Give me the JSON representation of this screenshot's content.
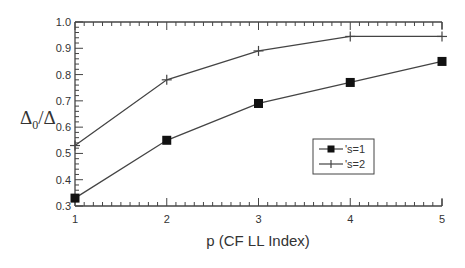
{
  "chart_data": {
    "type": "line",
    "title": "",
    "xlabel": "p (CF LL Index)",
    "ylabel": "Δ0/Δ",
    "ylabel_main": "Δ",
    "ylabel_sub": "0",
    "ylabel_tail": "/Δ",
    "x": [
      1,
      2,
      3,
      4,
      5
    ],
    "xlim": [
      1,
      5
    ],
    "ylim": [
      0.3,
      1.0
    ],
    "xticks": [
      "1",
      "2",
      "3",
      "4",
      "5"
    ],
    "yticks": [
      "0.3",
      "0.4",
      "0.5",
      "0.6",
      "0.7",
      "0.8",
      "0.9",
      "1.0"
    ],
    "grid": false,
    "legend_position": "lower right (inside)",
    "series": [
      {
        "name": "'s=1",
        "marker": "filled-square",
        "values": [
          0.33,
          0.55,
          0.69,
          0.77,
          0.85
        ]
      },
      {
        "name": "'s=2",
        "marker": "plus",
        "values": [
          0.53,
          0.78,
          0.89,
          0.945,
          0.945
        ]
      }
    ]
  }
}
